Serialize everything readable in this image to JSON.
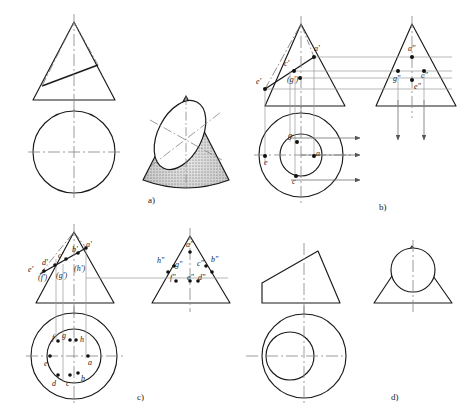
{
  "figure": {
    "title_visible": false,
    "panels": [
      {
        "key": "a",
        "label": "a)",
        "label_x": 148,
        "label_y": 196,
        "description": "cone cut by inclined plane - front view, top view and 3D pictorial"
      },
      {
        "key": "b",
        "label": "b)",
        "label_x": 379,
        "label_y": 203,
        "description": "cone with four points located - front, top and side views with projection arrows"
      },
      {
        "key": "c",
        "label": "c)",
        "label_x": 137,
        "label_y": 393,
        "description": "cone with eight points located - front, top and side views"
      },
      {
        "key": "d",
        "label": "d)",
        "label_x": 391,
        "label_y": 393,
        "description": "truncated cone - front view, top view and side view"
      }
    ]
  },
  "panel_a": {
    "front_view": {
      "apex_x": 74,
      "apex_y": 22,
      "base_left_x": 33,
      "base_right_x": 115,
      "base_y": 100,
      "cut_left_x": 42,
      "cut_left_y": 86,
      "cut_right_x": 98,
      "cut_right_y": 65
    },
    "top_view": {
      "cx": 74,
      "cy": 152,
      "r": 41
    },
    "pictorial": {
      "cx": 186,
      "cy": 140,
      "note": "shaded cut cone with stippled surface and elliptical section"
    }
  },
  "panel_b": {
    "front_view": {
      "apex_x": 301,
      "apex_y": 24,
      "base_left_x": 265,
      "base_right_x": 345,
      "base_y": 106
    },
    "side_view": {
      "apex_x": 412,
      "apex_y": 24,
      "base_left_x": 376,
      "base_right_x": 456,
      "base_y": 106
    },
    "top_view": {
      "cx": 301,
      "cy": 155,
      "outer_r": 42,
      "inner_r": 21
    },
    "points_front": [
      {
        "id": "a-prime",
        "label": "a'",
        "x": 314,
        "y": 51
      },
      {
        "id": "c-prime",
        "label": "c'",
        "x": 288,
        "y": 66
      },
      {
        "id": "e-prime",
        "label": "e'",
        "x": 265,
        "y": 82
      },
      {
        "id": "g-prime",
        "label": "(g')",
        "x": 294,
        "y": 81
      }
    ],
    "points_side": [
      {
        "id": "a-double-prime",
        "label": "a\"",
        "x": 412,
        "y": 50
      },
      {
        "id": "g-double-prime",
        "label": "g\"",
        "x": 398,
        "y": 78
      },
      {
        "id": "c-double-prime",
        "label": "c\"",
        "x": 424,
        "y": 75
      },
      {
        "id": "e-double-prime",
        "label": "e\"",
        "x": 417,
        "y": 86
      }
    ],
    "points_top": [
      {
        "id": "g",
        "label": "g",
        "x": 290,
        "y": 138
      },
      {
        "id": "e",
        "label": "e",
        "x": 272,
        "y": 161
      },
      {
        "id": "a",
        "label": "a",
        "x": 317,
        "y": 156
      },
      {
        "id": "c",
        "label": "c",
        "x": 291,
        "y": 180
      }
    ],
    "projection_arrows": {
      "horizontal_count": 2,
      "vertical_count": 2
    }
  },
  "panel_c": {
    "front_view": {
      "apex_x": 74,
      "apex_y": 232,
      "base_left_x": 36,
      "base_right_x": 114,
      "base_y": 303
    },
    "side_view": {
      "apex_x": 190,
      "apex_y": 236,
      "base_left_x": 152,
      "base_right_x": 230,
      "base_y": 303
    },
    "top_view": {
      "cx": 74,
      "cy": 356,
      "outer_r": 43,
      "inner_r": 27
    },
    "points_front": [
      {
        "id": "a-prime",
        "label": "a'",
        "x": 84,
        "y": 248
      },
      {
        "id": "b-prime",
        "label": "b'",
        "x": 74,
        "y": 253
      },
      {
        "id": "c-prime",
        "label": "c'",
        "x": 60,
        "y": 260
      },
      {
        "id": "d-prime",
        "label": "d'",
        "x": 48,
        "y": 267
      },
      {
        "id": "e-prime",
        "label": "e'",
        "x": 35,
        "y": 272
      },
      {
        "id": "f-prime",
        "label": "(f')",
        "x": 44,
        "y": 280
      },
      {
        "id": "g-prime",
        "label": "(g')",
        "x": 60,
        "y": 277
      },
      {
        "id": "h-prime",
        "label": "(h')",
        "x": 76,
        "y": 271
      }
    ],
    "points_side": [
      {
        "id": "a-double-prime",
        "label": "a\"",
        "x": 190,
        "y": 247
      },
      {
        "id": "h-double-prime",
        "label": "h\"",
        "x": 165,
        "y": 262
      },
      {
        "id": "g-double-prime",
        "label": "g\"",
        "x": 177,
        "y": 266
      },
      {
        "id": "c-double-prime",
        "label": "c\"",
        "x": 199,
        "y": 265
      },
      {
        "id": "b-double-prime",
        "label": "b\"",
        "x": 212,
        "y": 261
      },
      {
        "id": "f-double-prime",
        "label": "f\"",
        "x": 172,
        "y": 278
      },
      {
        "id": "e-double-prime",
        "label": "e\"",
        "x": 192,
        "y": 278
      },
      {
        "id": "d-double-prime",
        "label": "d\"",
        "x": 203,
        "y": 278
      }
    ],
    "points_top": [
      {
        "id": "f",
        "label": "f",
        "x": 57,
        "y": 338
      },
      {
        "id": "g",
        "label": "g",
        "x": 66,
        "y": 336
      },
      {
        "id": "h",
        "label": "h",
        "x": 80,
        "y": 340
      },
      {
        "id": "e",
        "label": "e",
        "x": 45,
        "y": 360
      },
      {
        "id": "a",
        "label": "a",
        "x": 93,
        "y": 358
      },
      {
        "id": "d",
        "label": "d",
        "x": 54,
        "y": 382
      },
      {
        "id": "c",
        "label": "c",
        "x": 66,
        "y": 382
      },
      {
        "id": "b",
        "label": "b",
        "x": 82,
        "y": 378
      }
    ]
  },
  "panel_d": {
    "front_view": {
      "apex_x": 318,
      "apex_y": 251,
      "base_left_x": 262,
      "base_right_x": 340,
      "base_y": 303
    },
    "side_view": {
      "apex_x": 412,
      "apex_y": 246,
      "base_left_x": 374,
      "base_right_x": 452,
      "base_y": 303,
      "circle_cx": 413,
      "circle_cy": 270,
      "circle_r": 22
    },
    "top_view": {
      "cx": 304,
      "cy": 356,
      "outer_r": 42,
      "inner_r": 24
    }
  },
  "style": {
    "line_color": "#1a1a1a",
    "center_line_color": "#7d7d7d",
    "projection_line_color": "#8c8c8c",
    "fill": "#ffffff"
  }
}
